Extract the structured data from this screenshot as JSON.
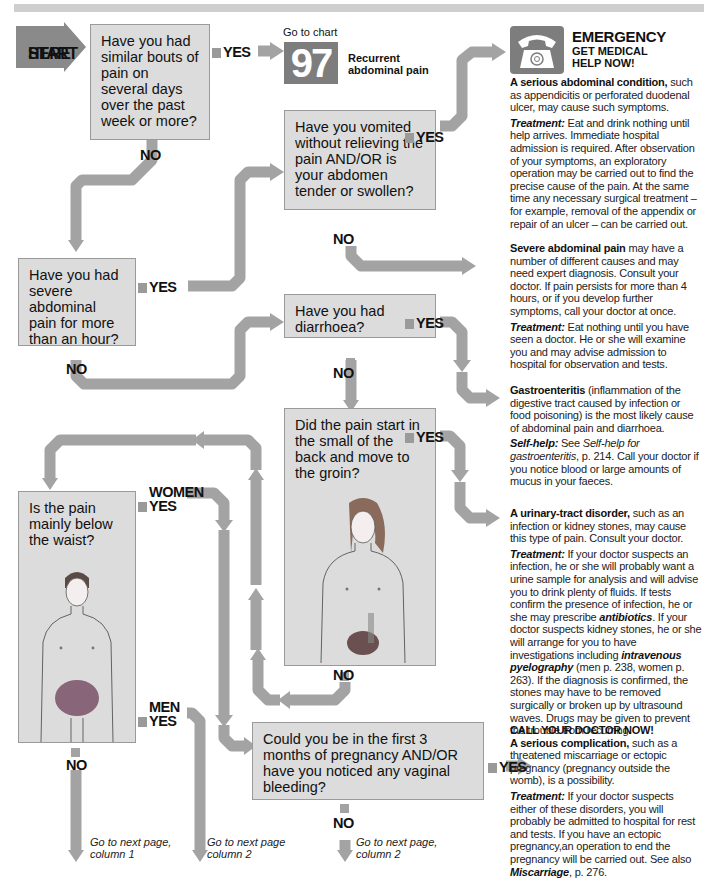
{
  "start": {
    "label_line1": "START",
    "label_line2": "HERE"
  },
  "questions": {
    "q1": "Have you had similar bouts of pain on several days over the past week or more?",
    "q2": "Have you had severe abdominal pain for more than an hour?",
    "q3": "Have you vomited without relieving the pain AND/OR is your abdomen tender or swollen?",
    "q4": "Have you had diarrhoea?",
    "q5": "Did the pain start in the small of the back and move to the groin?",
    "q6": "Is the pain mainly below the waist?",
    "q7": "Could you be in the first 3 months of pregnancy AND/OR have you noticed any vaginal bleeding?"
  },
  "labels": {
    "yes": "YES",
    "no": "NO",
    "women": "WOMEN",
    "men": "MEN"
  },
  "goto_chart": {
    "prefix": "Go to chart",
    "number": "97",
    "title_line1": "Recurrent",
    "title_line2": "abdominal pain"
  },
  "emergency": {
    "icon": "telephone-icon",
    "title": "EMERGENCY",
    "subtitle_line1": "GET MEDICAL",
    "subtitle_line2": "HELP NOW!",
    "lead_bold": "A serious abdominal condition,",
    "lead_rest": " such as appendicitis or perforated duodenal ulcer, may cause such symptoms.",
    "treatment_label": "Treatment:",
    "treatment_text": " Eat and drink nothing until help arrives. Immediate hospital admission is required. After observation of your symptoms, an exploratory operation may be carried out to find the precise cause of the pain. At the same time any necessary surgical treatment – for example, removal of the appendix or repair of an ulcer – can be carried out."
  },
  "severe": {
    "lead_bold": "Severe abdominal pain",
    "lead_rest": " may have a number of different causes and may need expert diagnosis. Consult your doctor. If pain persists for more than 4 hours, or if you develop further symptoms, call your doctor at once.",
    "treatment_label": "Treatment:",
    "treatment_text": " Eat nothing until you have seen a doctor. He or she will examine you and may advise admission to hospital for observation and tests."
  },
  "gastro": {
    "lead_bold": "Gastroenteritis",
    "lead_rest": " (inflammation of the digestive tract caused by infection or food poisoning) is the most likely cause of abdominal pain and diarrhoea.",
    "selfhelp_label": "Self-help:",
    "selfhelp_pre": " See ",
    "selfhelp_link": "Self-help for gastroenteritis",
    "selfhelp_post": ", p. 214. Call your doctor if you notice blood or large amounts of mucus in your faeces."
  },
  "urinary": {
    "lead_bold": "A urinary-tract disorder,",
    "lead_rest": " such as an infection or kidney stones, may cause this type of pain. Consult your doctor.",
    "treatment_label": "Treatment:",
    "t1": " If your doctor suspects an infection, he or she will probably want a urine sample for analysis and will advise you to drink plenty of fluids. If tests confirm the presence of infection, he or she may prescribe ",
    "t_link1": "antibiotics",
    "t2": ". If your doctor suspects kidney stones, he or she will arrange for you to have investigations including ",
    "t_link2": "intravenous pyelography",
    "t3": " (men p. 238, women p. 263). If the diagnosis is confirmed, the stones may have to be removed surgically or broken up by ultrasound waves. Drugs may be given to prevent the trouble from recurring."
  },
  "pregnancy": {
    "header": "CALL YOUR DOCTOR NOW!",
    "lead_bold": "A serious complication,",
    "lead_rest": " such as a threatened miscarriage or ectopic pregnancy (pregnancy outside the womb), is a possibility.",
    "treatment_label": "Treatment:",
    "t1": " If your doctor suspects either of these disorders, you will probably be admitted to hospital for rest and tests. If you have an ectopic pregnancy,an operation to end the pregnancy will be carried out. See also ",
    "t_link": "Miscarriage",
    "t2": ", p. 276."
  },
  "goto_next": {
    "a_line1": "Go to next page,",
    "a_line2": "column 1",
    "b_line1": "Go to next page",
    "b_line2": "column 2",
    "c_line1": "Go to next page,",
    "c_line2": "column 2"
  },
  "colors": {
    "box_fill": "#dcdcdc",
    "box_border": "#9a9a9a",
    "arrow": "#a3a3a3",
    "start_arrow": "#8a8a8a",
    "dark_panel": "#7d7d7d"
  }
}
